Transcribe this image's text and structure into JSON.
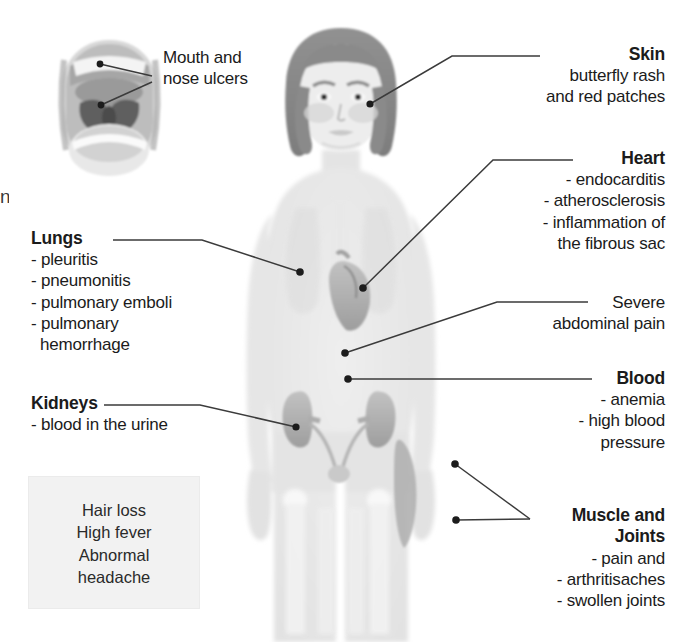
{
  "figure": {
    "background_color": "#ffffff",
    "body_fill": "#e9e9e9",
    "organ_fill": "#b4b4b4",
    "hair_fill": "#8c8c8c",
    "leader_color": "#3b3b3b",
    "panel_fill": "#f2f2f2"
  },
  "artifacts": {
    "left_edge_fragment": "n"
  },
  "callouts": {
    "mouth": {
      "name": "Mouth and nose ulcers",
      "lines": [
        "Mouth and",
        "nose ulcers"
      ],
      "align": "left"
    },
    "skin": {
      "title": "Skin",
      "lines": [
        "butterfly rash",
        "and red patches"
      ],
      "align": "right"
    },
    "heart": {
      "title": "Heart",
      "lines": [
        "- endocarditis",
        "- atherosclerosis",
        "- inflammation of",
        "the fibrous sac"
      ],
      "align": "right"
    },
    "lungs": {
      "title": "Lungs",
      "lines": [
        "- pleuritis",
        "- pneumonitis",
        "- pulmonary emboli",
        "- pulmonary",
        "  hemorrhage"
      ],
      "align": "left"
    },
    "abdominal": {
      "lines": [
        "Severe",
        "abdominal pain"
      ],
      "align": "right"
    },
    "blood": {
      "title": "Blood",
      "lines": [
        "- anemia",
        "- high blood",
        "pressure"
      ],
      "align": "right"
    },
    "kidneys": {
      "title": "Kidneys",
      "lines": [
        "- blood in the urine"
      ],
      "align": "left"
    },
    "muscle": {
      "title_lines": [
        "Muscle and",
        "Joints"
      ],
      "lines": [
        "- pain and",
        "- arthritisaches",
        "- swollen joints"
      ],
      "align": "right"
    }
  },
  "general_panel": {
    "items": [
      "Hair loss",
      "High fever",
      "Abnormal",
      "headache"
    ]
  }
}
